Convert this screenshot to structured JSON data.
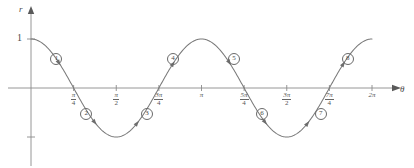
{
  "figure": {
    "kind": "polar-cosine-plot",
    "axes": {
      "y_axis_label": "r",
      "x_axis_label": "θ",
      "y_tick_label_top": "1",
      "x_origin_label": ""
    },
    "x_ticks": [
      {
        "id": "pi-over-4",
        "num": "π",
        "den": "4",
        "plain": "π/4",
        "x_value": 0.7853981634
      },
      {
        "id": "pi-over-2",
        "num": "π",
        "den": "2",
        "plain": "π/2",
        "x_value": 1.5707963268
      },
      {
        "id": "3pi-over-4",
        "num": "3π",
        "den": "4",
        "plain": "3π/4",
        "x_value": 2.3561944902
      },
      {
        "id": "pi",
        "num": "",
        "den": "",
        "plain": "π",
        "x_value": 3.1415926536
      },
      {
        "id": "5pi-over-4",
        "num": "5π",
        "den": "4",
        "plain": "5π/4",
        "x_value": 3.926990817
      },
      {
        "id": "3pi-over-2",
        "num": "3π",
        "den": "2",
        "plain": "3π/2",
        "x_value": 4.7123889804
      },
      {
        "id": "7pi-over-4",
        "num": "7π",
        "den": "4",
        "plain": "7π/4",
        "x_value": 5.4977871438
      },
      {
        "id": "2pi",
        "num": "",
        "den": "",
        "plain": "2π",
        "x_value": 6.2831853072
      }
    ],
    "segment_markers": [
      {
        "label": "①",
        "n": "1"
      },
      {
        "label": "②",
        "n": "2"
      },
      {
        "label": "③",
        "n": "3"
      },
      {
        "label": "④",
        "n": "4"
      },
      {
        "label": "⑤",
        "n": "5"
      },
      {
        "label": "⑥",
        "n": "6"
      },
      {
        "label": "⑦",
        "n": "7"
      },
      {
        "label": "⑧",
        "n": "8"
      }
    ],
    "colors": {
      "curve": "#7a7a7a",
      "axis": "#8a8a8a",
      "text": "#4a4a4a",
      "background": "#ffffff"
    }
  },
  "chart_data": {
    "type": "line",
    "title": "",
    "xlabel": "θ",
    "ylabel": "r",
    "xlim": [
      0,
      6.2831853072
    ],
    "ylim": [
      -1,
      1
    ],
    "grid": false,
    "legend": "none",
    "function": "r = cos(2θ)",
    "xtick_labels": [
      "π/4",
      "π/2",
      "3π/4",
      "π",
      "5π/4",
      "3π/2",
      "7π/4",
      "2π"
    ],
    "xtick_values": [
      0.785398,
      1.570796,
      2.356194,
      3.141593,
      3.926991,
      4.712389,
      5.497787,
      6.283185
    ],
    "ytick_labels": [
      "1"
    ],
    "ytick_values": [
      1
    ],
    "series": [
      {
        "name": "r = cos(2θ)",
        "x": [
          0,
          0.3927,
          0.7854,
          1.1781,
          1.5708,
          1.9635,
          2.3562,
          2.7489,
          3.1416,
          3.5343,
          3.927,
          4.3197,
          4.7124,
          5.1051,
          5.4978,
          5.8905,
          6.2832
        ],
        "y": [
          1,
          0.7071,
          0,
          -0.7071,
          -1,
          -0.7071,
          0,
          0.7071,
          1,
          0.7071,
          0,
          -0.7071,
          -1,
          -0.7071,
          0,
          0.7071,
          1
        ]
      }
    ],
    "annotations": [
      {
        "text": "①",
        "theta_range": "0 to π/4",
        "x": 0.45,
        "y": 0.62
      },
      {
        "text": "②",
        "theta_range": "π/4 to π/2",
        "x": 1.0,
        "y": -0.52
      },
      {
        "text": "③",
        "theta_range": "π/2 to 3π/4",
        "x": 2.12,
        "y": -0.52
      },
      {
        "text": "④",
        "theta_range": "3π/4 to π",
        "x": 2.6,
        "y": 0.62
      },
      {
        "text": "⑤",
        "theta_range": "π to 5π/4",
        "x": 3.72,
        "y": 0.62
      },
      {
        "text": "⑥",
        "theta_range": "5π/4 to 3π/2",
        "x": 4.24,
        "y": -0.52
      },
      {
        "text": "⑦",
        "theta_range": "3π/2 to 7π/4",
        "x": 5.32,
        "y": -0.52
      },
      {
        "text": "⑧",
        "theta_range": "7π/4 to 2π",
        "x": 5.82,
        "y": 0.62
      }
    ]
  }
}
